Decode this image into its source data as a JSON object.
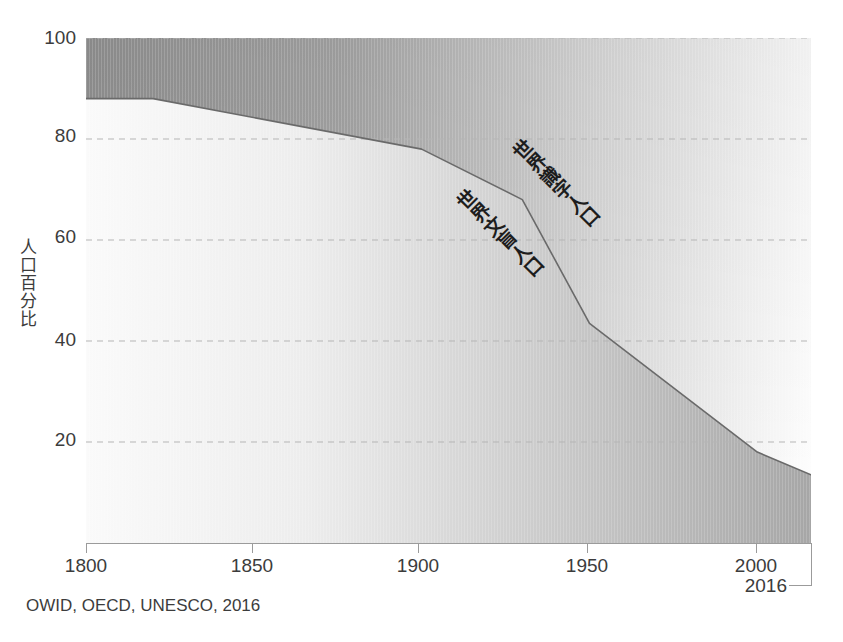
{
  "chart_data": {
    "type": "area",
    "title": "",
    "subtitle": "",
    "xlabel": "",
    "ylabel": "人口百分比",
    "xlim": [
      1800,
      2016
    ],
    "ylim": [
      0,
      100
    ],
    "grid": true,
    "legend_position": "inline-annotations",
    "x": [
      1800,
      1820,
      1900,
      1930,
      1950,
      2000,
      2016
    ],
    "series": [
      {
        "name": "世界文盲人口",
        "key": "illiterate",
        "values": [
          88,
          88,
          78,
          68,
          43.5,
          18,
          13.5
        ],
        "fill_from": "bottom",
        "color_left": "#f7f7f7",
        "color_right": "#a6a6a6"
      },
      {
        "name": "世界識字人口",
        "key": "literate",
        "values": [
          12,
          12,
          22,
          32,
          56.5,
          82,
          86.5
        ],
        "fill_from": "top",
        "color_left": "#9a9a9a",
        "color_right": "#fdfdfd"
      }
    ],
    "boundary_line_color": "#6e6e6e",
    "xticks": [
      1800,
      1850,
      1900,
      1950,
      2000
    ],
    "xtick_labels": [
      "1800",
      "1850",
      "1900",
      "1950",
      "2000"
    ],
    "end_tick_label": "2016",
    "yticks": [
      20,
      40,
      60,
      80,
      100
    ],
    "ytick_labels": [
      "20",
      "40",
      "60",
      "80",
      "100"
    ],
    "annotations": [
      {
        "text": "世界識字人口",
        "x": 1930,
        "y": 48
      },
      {
        "text": "世界文盲人口",
        "x": 1913,
        "y": 30
      }
    ],
    "source": "OWID, OECD, UNESCO, 2016"
  },
  "axes": {
    "y_title": "人口百分比",
    "ytick_labels": [
      "100",
      "80",
      "60",
      "40",
      "20"
    ],
    "xtick_labels": [
      "1800",
      "1850",
      "1900",
      "1950",
      "2000"
    ],
    "end_label": "2016"
  },
  "annotations": {
    "literate": "世界識字人口",
    "illiterate": "世界文盲人口"
  },
  "footer": {
    "source": "OWID, OECD, UNESCO, 2016"
  },
  "colors": {
    "grid": "#bdbdbd",
    "axis": "#9b9b9b",
    "text": "#3c3c3c",
    "boundary": "#6e6e6e"
  }
}
